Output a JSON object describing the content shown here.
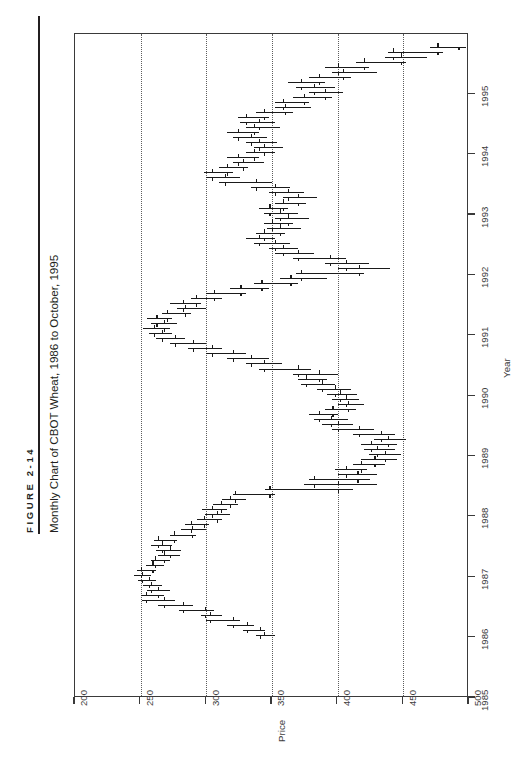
{
  "figure": {
    "number_label": "FIGURE 2-14",
    "title": "Monthly Chart of CBOT Wheat, 1986 to October, 1995"
  },
  "chart_data": {
    "type": "bar",
    "subtype": "ohlc-high-low-open-close",
    "orientation": "rotated-90ccw",
    "title": "Monthly Chart of CBOT Wheat, 1986 to October, 1995",
    "xlabel": "Year",
    "ylabel": "Price",
    "xlim": [
      1985.0,
      1996.0
    ],
    "ylim": [
      200,
      500
    ],
    "grid": "dotted vertical gridlines at each price tick",
    "legend": "none",
    "x_ticks": [
      "1985",
      "1986",
      "1987",
      "1988",
      "1989",
      "1990",
      "1991",
      "1992",
      "1993",
      "1994",
      "1995"
    ],
    "x_tick_values": [
      1985,
      1986,
      1987,
      1988,
      1989,
      1990,
      1991,
      1992,
      1993,
      1994,
      1995
    ],
    "y_ticks": [
      "500",
      "450",
      "400",
      "350",
      "300",
      "250",
      "200"
    ],
    "y_tick_values": [
      500,
      450,
      400,
      350,
      300,
      250,
      200
    ],
    "series_name": "CBOT Wheat monthly OHLC",
    "columns": [
      "date",
      "open",
      "high",
      "low",
      "close"
    ],
    "bars": [
      [
        "1986-01",
        344,
        352,
        338,
        341
      ],
      [
        "1986-02",
        341,
        345,
        328,
        331
      ],
      [
        "1986-03",
        331,
        336,
        316,
        320
      ],
      [
        "1986-04",
        320,
        326,
        300,
        303
      ],
      [
        "1986-05",
        303,
        312,
        296,
        299
      ],
      [
        "1986-06",
        299,
        306,
        279,
        282
      ],
      [
        "1986-07",
        282,
        290,
        263,
        268
      ],
      [
        "1986-08",
        268,
        276,
        251,
        254
      ],
      [
        "1986-09",
        254,
        268,
        250,
        263
      ],
      [
        "1986-10",
        263,
        272,
        255,
        258
      ],
      [
        "1986-11",
        258,
        266,
        252,
        256
      ],
      [
        "1986-12",
        256,
        262,
        248,
        251
      ],
      [
        "1987-01",
        251,
        258,
        245,
        250
      ],
      [
        "1987-02",
        250,
        262,
        247,
        259
      ],
      [
        "1987-03",
        259,
        268,
        254,
        261
      ],
      [
        "1987-04",
        261,
        272,
        258,
        268
      ],
      [
        "1987-05",
        268,
        280,
        263,
        272
      ],
      [
        "1987-06",
        272,
        281,
        262,
        266
      ],
      [
        "1987-07",
        266,
        274,
        258,
        263
      ],
      [
        "1987-08",
        263,
        278,
        260,
        275
      ],
      [
        "1987-09",
        275,
        292,
        272,
        289
      ],
      [
        "1987-10",
        289,
        300,
        281,
        288
      ],
      [
        "1987-11",
        288,
        302,
        284,
        298
      ],
      [
        "1987-12",
        298,
        312,
        293,
        308
      ],
      [
        "1988-01",
        308,
        318,
        299,
        304
      ],
      [
        "1988-02",
        304,
        316,
        297,
        311
      ],
      [
        "1988-03",
        311,
        324,
        305,
        318
      ],
      [
        "1988-04",
        318,
        330,
        312,
        322
      ],
      [
        "1988-05",
        322,
        352,
        320,
        348
      ],
      [
        "1988-06",
        348,
        412,
        345,
        400
      ],
      [
        "1988-07",
        400,
        430,
        374,
        382
      ],
      [
        "1988-08",
        382,
        425,
        378,
        415
      ],
      [
        "1988-09",
        415,
        430,
        400,
        406
      ],
      [
        "1988-10",
        406,
        422,
        398,
        418
      ],
      [
        "1988-11",
        418,
        436,
        412,
        428
      ],
      [
        "1988-12",
        428,
        445,
        418,
        436
      ],
      [
        "1989-01",
        436,
        448,
        424,
        430
      ],
      [
        "1989-02",
        430,
        444,
        420,
        425
      ],
      [
        "1989-03",
        425,
        445,
        418,
        438
      ],
      [
        "1989-04",
        438,
        452,
        428,
        433
      ],
      [
        "1989-05",
        433,
        444,
        412,
        416
      ],
      [
        "1989-06",
        416,
        428,
        396,
        400
      ],
      [
        "1989-07",
        400,
        412,
        388,
        395
      ],
      [
        "1989-08",
        395,
        408,
        382,
        386
      ],
      [
        "1989-09",
        386,
        400,
        378,
        396
      ],
      [
        "1989-10",
        396,
        414,
        390,
        408
      ],
      [
        "1989-11",
        408,
        420,
        400,
        406
      ],
      [
        "1989-12",
        406,
        416,
        396,
        402
      ],
      [
        "1990-01",
        402,
        415,
        392,
        398
      ],
      [
        "1990-02",
        398,
        410,
        384,
        388
      ],
      [
        "1990-03",
        388,
        398,
        372,
        376
      ],
      [
        "1990-04",
        376,
        392,
        370,
        386
      ],
      [
        "1990-05",
        386,
        400,
        366,
        370
      ],
      [
        "1990-06",
        370,
        380,
        340,
        344
      ],
      [
        "1990-07",
        344,
        358,
        330,
        334
      ],
      [
        "1990-08",
        334,
        348,
        316,
        320
      ],
      [
        "1990-09",
        320,
        330,
        300,
        304
      ],
      [
        "1990-10",
        304,
        312,
        286,
        290
      ],
      [
        "1990-11",
        290,
        300,
        272,
        276
      ],
      [
        "1990-12",
        276,
        284,
        262,
        266
      ],
      [
        "1991-01",
        266,
        274,
        256,
        260
      ],
      [
        "1991-02",
        260,
        272,
        252,
        268
      ],
      [
        "1991-03",
        268,
        278,
        258,
        262
      ],
      [
        "1991-04",
        262,
        274,
        255,
        270
      ],
      [
        "1991-05",
        270,
        288,
        266,
        284
      ],
      [
        "1991-06",
        284,
        300,
        278,
        282
      ],
      [
        "1991-07",
        282,
        296,
        272,
        292
      ],
      [
        "1991-08",
        292,
        312,
        288,
        306
      ],
      [
        "1991-09",
        306,
        330,
        300,
        326
      ],
      [
        "1991-10",
        326,
        348,
        318,
        342
      ],
      [
        "1991-11",
        342,
        370,
        336,
        364
      ],
      [
        "1991-12",
        364,
        392,
        356,
        372
      ],
      [
        "1992-01",
        372,
        420,
        368,
        416
      ],
      [
        "1992-02",
        416,
        440,
        400,
        406
      ],
      [
        "1992-03",
        406,
        424,
        390,
        394
      ],
      [
        "1992-04",
        394,
        406,
        366,
        370
      ],
      [
        "1992-05",
        370,
        382,
        352,
        358
      ],
      [
        "1992-06",
        358,
        370,
        348,
        352
      ],
      [
        "1992-07",
        352,
        364,
        336,
        340
      ],
      [
        "1992-08",
        340,
        352,
        330,
        344
      ],
      [
        "1992-09",
        344,
        360,
        338,
        356
      ],
      [
        "1992-10",
        356,
        372,
        346,
        350
      ],
      [
        "1992-11",
        350,
        366,
        344,
        362
      ],
      [
        "1992-12",
        362,
        378,
        352,
        356
      ],
      [
        "1993-01",
        356,
        370,
        344,
        348
      ],
      [
        "1993-02",
        348,
        362,
        340,
        358
      ],
      [
        "1993-03",
        358,
        376,
        352,
        370
      ],
      [
        "1993-04",
        370,
        384,
        358,
        362
      ],
      [
        "1993-05",
        362,
        374,
        348,
        352
      ],
      [
        "1993-06",
        352,
        364,
        334,
        338
      ],
      [
        "1993-07",
        338,
        350,
        310,
        314
      ],
      [
        "1993-08",
        314,
        326,
        300,
        304
      ],
      [
        "1993-09",
        304,
        320,
        298,
        316
      ],
      [
        "1993-10",
        316,
        332,
        310,
        328
      ],
      [
        "1993-11",
        328,
        344,
        320,
        324
      ],
      [
        "1993-12",
        324,
        340,
        316,
        336
      ],
      [
        "1994-01",
        336,
        352,
        330,
        344
      ],
      [
        "1994-02",
        344,
        358,
        336,
        340
      ],
      [
        "1994-03",
        340,
        354,
        330,
        334
      ],
      [
        "1994-04",
        334,
        346,
        320,
        324
      ],
      [
        "1994-05",
        324,
        340,
        316,
        336
      ],
      [
        "1994-06",
        336,
        356,
        330,
        340
      ],
      [
        "1994-07",
        340,
        352,
        326,
        330
      ],
      [
        "1994-08",
        330,
        348,
        324,
        344
      ],
      [
        "1994-09",
        344,
        366,
        338,
        360
      ],
      [
        "1994-10",
        360,
        380,
        352,
        358
      ],
      [
        "1994-11",
        358,
        378,
        352,
        374
      ],
      [
        "1994-12",
        374,
        396,
        366,
        390
      ],
      [
        "1995-01",
        390,
        404,
        378,
        382
      ],
      [
        "1995-02",
        382,
        398,
        368,
        372
      ],
      [
        "1995-03",
        372,
        390,
        362,
        386
      ],
      [
        "1995-04",
        386,
        410,
        378,
        404
      ],
      [
        "1995-05",
        404,
        430,
        396,
        400
      ],
      [
        "1995-06",
        400,
        424,
        390,
        420
      ],
      [
        "1995-07",
        420,
        452,
        414,
        448
      ],
      [
        "1995-08",
        448,
        468,
        436,
        442
      ],
      [
        "1995-09",
        442,
        480,
        438,
        476
      ],
      [
        "1995-10",
        476,
        498,
        470,
        492
      ]
    ]
  }
}
